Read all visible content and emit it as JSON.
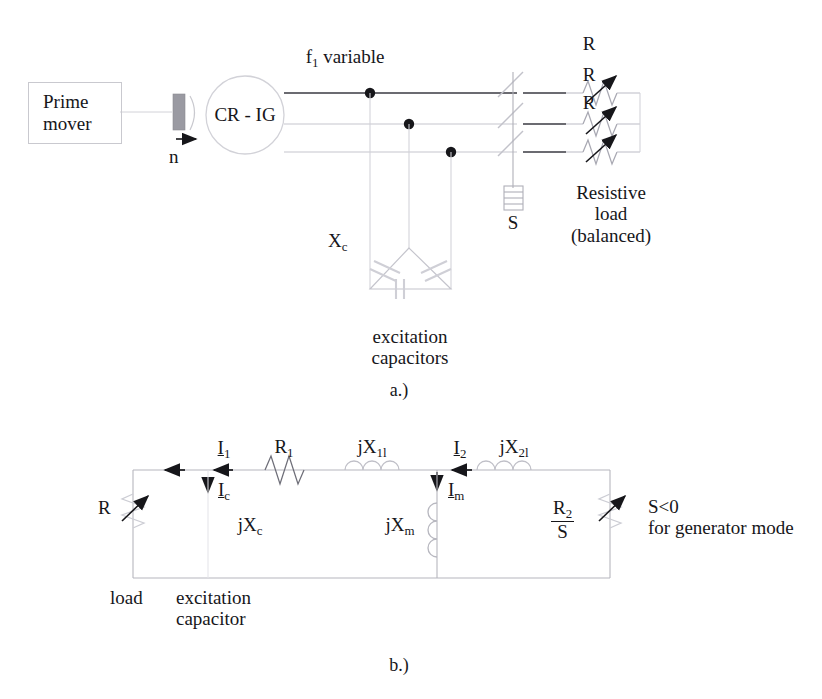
{
  "figure": {
    "title_a": "a.)",
    "title_b": "b.)"
  },
  "diagram_a": {
    "name": "self-excited-induction-generator-schematic",
    "prime_mover": "Prime\nmover",
    "prime_mover_line1": "Prime",
    "prime_mover_line2": "mover",
    "shaft_speed_label": "n",
    "machine_label": "CR - IG",
    "frequency_label": "f1 variable",
    "frequency_label_main": "f",
    "frequency_label_sub": "1",
    "frequency_label_tail": " variable",
    "capacitor_reactance": "Xc",
    "capacitor_reactance_main": "X",
    "capacitor_reactance_sub": "c",
    "capacitor_caption_line1": "excitation",
    "capacitor_caption_line2": "capacitors",
    "switch_label": "S",
    "load_resistor_labels": [
      "R",
      "R",
      "R"
    ],
    "load_caption_line1": "Resistive",
    "load_caption_line2": "load",
    "load_caption_line3": "(balanced)"
  },
  "diagram_b": {
    "name": "per-phase-equivalent-circuit",
    "load_resistor": "R",
    "load_caption": "load",
    "current_i1_main": "I",
    "current_i1_sub": "1",
    "current_ic_main": "I",
    "current_ic_sub": "c",
    "current_i2_main": "I",
    "current_i2_sub": "2",
    "current_im_main": "I",
    "current_im_sub": "m",
    "stator_resistance_main": "R",
    "stator_resistance_sub": "1",
    "stator_leakage_main": "jX",
    "stator_leakage_sub": "1l",
    "rotor_leakage_main": "jX",
    "rotor_leakage_sub": "2l",
    "capacitive_reactance_main": "jX",
    "capacitive_reactance_sub": "c",
    "magnetizing_reactance_main": "jX",
    "magnetizing_reactance_sub": "m",
    "rotor_resistance_num_main": "R",
    "rotor_resistance_num_sub": "2",
    "rotor_resistance_den": "S",
    "excitation_caption_line1": "excitation",
    "excitation_caption_line2": "capacitor",
    "note_line1": "S<0",
    "note_line2": "for generator mode"
  },
  "colors": {
    "ink": "#16161a",
    "wire_dark": "#3a3a42",
    "wire_faint": "#b8b8c0",
    "wire_very_faint": "#d2d2d8",
    "coupling_fill": "#9a9aa2",
    "box_border": "#c9c9cf"
  }
}
